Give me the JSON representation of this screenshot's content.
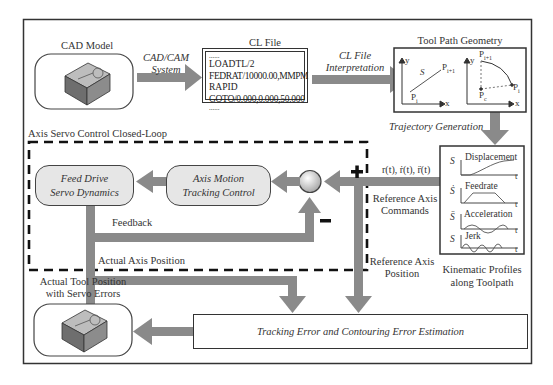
{
  "cad_model": {
    "title": "CAD Model",
    "icon": "workpiece-block-icon"
  },
  "arrow_cad_to_cl": {
    "line1": "CAD/CAM",
    "line2": "System"
  },
  "cl_file": {
    "title": "CL File",
    "lines": [
      "......",
      "LOADTL/2",
      "FEDRAT/10000.00,MMPM",
      "RAPID",
      "GOTO/0.000,0.000,50.000",
      "......"
    ]
  },
  "arrow_cl_to_geometry": {
    "line1": "CL File",
    "line2": "Interpretation"
  },
  "tool_path_geometry": {
    "title": "Tool Path Geometry",
    "linear": {
      "y_axis": "y",
      "x_axis": "x",
      "start": "P",
      "start_sub": "i",
      "end": "P",
      "end_sub": "i+1",
      "segment": "S"
    },
    "circular": {
      "y_axis": "y",
      "x_axis": "x",
      "start": "P",
      "start_sub": "i",
      "end": "P",
      "end_sub": "i+1",
      "center": "P",
      "center_sub": "c"
    }
  },
  "trajectory_generation": "Trajectory Generation",
  "kinematic_profiles": {
    "caption_line1": "Kinematic Profiles",
    "caption_line2": "along Toolpath",
    "profiles": [
      {
        "symbol": "S",
        "label": "Displacement",
        "t": "t"
      },
      {
        "symbol": "Ṡ",
        "label": "Feedrate",
        "t": "t"
      },
      {
        "symbol": "S̈",
        "label": "Acceleration",
        "t": "t"
      },
      {
        "symbol": "S⃛",
        "label": "Jerk",
        "t": "t"
      }
    ]
  },
  "reference_signals": {
    "formula": "r(t), ṙ(t), r̈(t)",
    "commands_line1": "Reference Axis",
    "commands_line2": "Commands",
    "position_line1": "Reference Axis",
    "position_line2": "Position"
  },
  "servo_loop": {
    "title": "Axis Servo Control Closed-Loop",
    "feed_drive_line1": "Feed Drive",
    "feed_drive_line2": "Servo Dynamics",
    "tracking_control_line1": "Axis Motion",
    "tracking_control_line2": "Tracking Control",
    "plus_sign": "+",
    "minus_sign": "−",
    "feedback_label": "Feedback"
  },
  "actual_axis_position": "Actual Axis Position",
  "actual_tool": {
    "title_line1": "Actual Tool Position",
    "title_line2": "with Servo Errors",
    "icon": "workpiece-block-icon"
  },
  "error_estimation": "Tracking Error and Contouring Error Estimation",
  "colors": {
    "arrow": "#8a8a8a",
    "frame": "#333333",
    "pill_fill": "#e6e6e6"
  }
}
